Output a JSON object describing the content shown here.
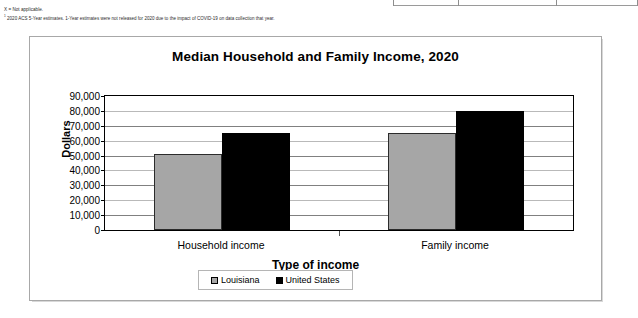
{
  "footnotes": {
    "line1": "X = Not applicable.",
    "line2_marker": "1",
    "line2": "2020 ACS 5-Year estimates. 1-Year estimates were not released for 2020 due to the impact of COVID-19 on data collection that year."
  },
  "chart_data": {
    "type": "bar",
    "title": "Median Household and Family Income, 2020",
    "xlabel": "Type of income",
    "ylabel": "Dollars",
    "categories": [
      "Household income",
      "Family income"
    ],
    "series": [
      {
        "name": "Louisiana",
        "color": "#a6a6a6",
        "values": [
          51000,
          65000
        ]
      },
      {
        "name": "United States",
        "color": "#000000",
        "values": [
          65000,
          80000
        ]
      }
    ],
    "ylim": [
      0,
      90000
    ],
    "ytick_values": [
      0,
      10000,
      20000,
      30000,
      40000,
      50000,
      60000,
      70000,
      80000,
      90000
    ],
    "ytick_labels": [
      "0",
      "10,000",
      "20,000",
      "30,000",
      "40,000",
      "50,000",
      "60,000",
      "70,000",
      "80,000",
      "90,000"
    ],
    "grid": true,
    "legend_position": "bottom"
  }
}
